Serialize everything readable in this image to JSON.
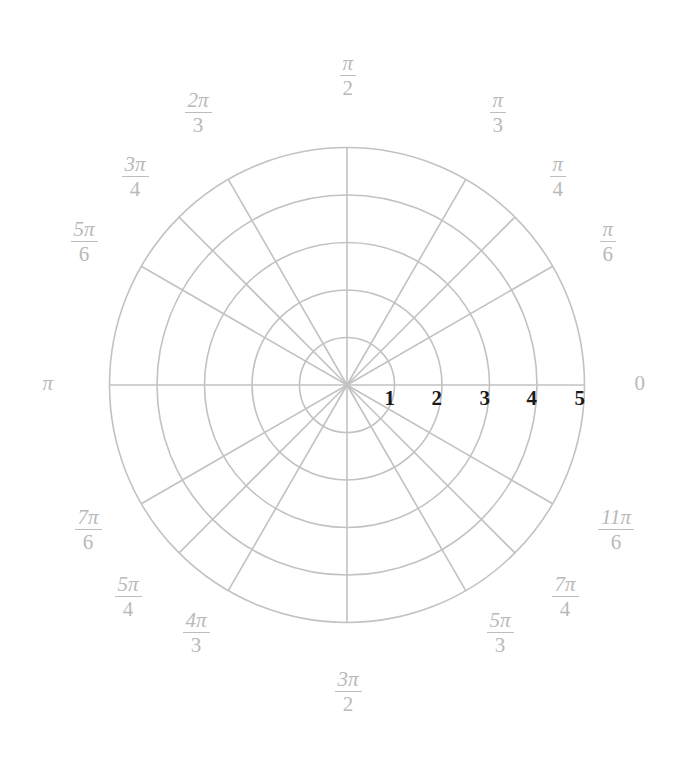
{
  "figure": {
    "type": "polar-grid",
    "title": "",
    "background": "#ffffff",
    "grid_color": "#bdbdbd",
    "label_color": "#b9b9b9",
    "tick_label_color": "#1a1a1a"
  },
  "chart_data": {
    "type": "polar-grid",
    "title": "",
    "xlabel": "",
    "ylabel": "",
    "grid": true,
    "legend": "none",
    "center_px": [
      347,
      385
    ],
    "radius_step_px": 47.5,
    "radial_ticks": {
      "values": [
        1,
        2,
        3,
        4,
        5
      ],
      "labels": [
        "1",
        "2",
        "3",
        "4",
        "5"
      ],
      "rlim": [
        0,
        5
      ]
    },
    "angular_ticks": {
      "count": 12,
      "step_deg": 30,
      "extra_spokes_deg": [
        45,
        135,
        225,
        315
      ],
      "entries": [
        {
          "deg": 0,
          "num": "",
          "den": "",
          "plain": "0",
          "x": 640,
          "y": 383,
          "align": "left"
        },
        {
          "deg": 30,
          "num": "π",
          "den": "6",
          "plain": "",
          "x": 608,
          "y": 242,
          "align": "center"
        },
        {
          "deg": 45,
          "num": "π",
          "den": "4",
          "plain": "",
          "x": 558,
          "y": 177,
          "align": "center"
        },
        {
          "deg": 60,
          "num": "π",
          "den": "3",
          "plain": "",
          "x": 498,
          "y": 113,
          "align": "center"
        },
        {
          "deg": 90,
          "num": "π",
          "den": "2",
          "plain": "",
          "x": 348,
          "y": 76,
          "align": "center"
        },
        {
          "deg": 120,
          "num": "2π",
          "den": "3",
          "plain": "",
          "x": 198,
          "y": 113,
          "align": "center"
        },
        {
          "deg": 135,
          "num": "3π",
          "den": "4",
          "plain": "",
          "x": 135,
          "y": 177,
          "align": "center"
        },
        {
          "deg": 150,
          "num": "5π",
          "den": "6",
          "plain": "",
          "x": 84,
          "y": 242,
          "align": "center"
        },
        {
          "deg": 180,
          "num": "",
          "den": "",
          "plain": "π",
          "x": 48,
          "y": 383,
          "align": "center"
        },
        {
          "deg": 210,
          "num": "7π",
          "den": "6",
          "plain": "",
          "x": 88,
          "y": 530,
          "align": "center"
        },
        {
          "deg": 225,
          "num": "5π",
          "den": "4",
          "plain": "",
          "x": 128,
          "y": 597,
          "align": "center"
        },
        {
          "deg": 240,
          "num": "4π",
          "den": "3",
          "plain": "",
          "x": 196,
          "y": 633,
          "align": "center"
        },
        {
          "deg": 270,
          "num": "3π",
          "den": "2",
          "plain": "",
          "x": 348,
          "y": 692,
          "align": "center"
        },
        {
          "deg": 300,
          "num": "5π",
          "den": "3",
          "plain": "",
          "x": 500,
          "y": 633,
          "align": "center"
        },
        {
          "deg": 315,
          "num": "7π",
          "den": "4",
          "plain": "",
          "x": 565,
          "y": 597,
          "align": "center"
        },
        {
          "deg": 330,
          "num": "11π",
          "den": "6",
          "plain": "",
          "x": 616,
          "y": 530,
          "align": "center"
        }
      ]
    },
    "radial_tick_positions": [
      {
        "label": "1",
        "x": 390,
        "y": 398
      },
      {
        "label": "2",
        "x": 437,
        "y": 398
      },
      {
        "label": "3",
        "x": 485,
        "y": 398
      },
      {
        "label": "4",
        "x": 532,
        "y": 398
      },
      {
        "label": "5",
        "x": 580,
        "y": 398
      }
    ]
  }
}
